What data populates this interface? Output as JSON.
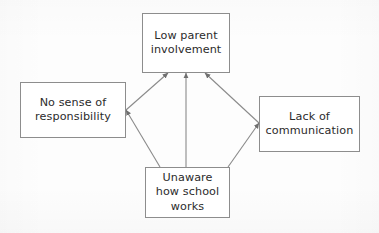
{
  "diagram": {
    "background_color": "#fdfdfd",
    "node_fill": "#ffffff",
    "node_stroke": "#8d8d8d",
    "text_color": "#2b2b2b",
    "edge_color": "#8a8a8a",
    "nodes": [
      {
        "id": "low-parent-involvement",
        "label": "Low parent\ninvolvement",
        "x": 142,
        "y": 13,
        "w": 88,
        "h": 60
      },
      {
        "id": "no-sense-of-responsibility",
        "label": "No sense of\nresponsibility",
        "x": 20,
        "y": 82,
        "w": 106,
        "h": 56
      },
      {
        "id": "lack-of-communication",
        "label": "Lack of\ncommunication",
        "x": 259,
        "y": 96,
        "w": 101,
        "h": 56
      },
      {
        "id": "unaware-how-school-works",
        "label": "Unaware\nhow school\nworks",
        "x": 145,
        "y": 167,
        "w": 85,
        "h": 51
      }
    ],
    "edges": [
      {
        "id": "responsibility-to-involvement",
        "from": "no-sense-of-responsibility",
        "to": "low-parent-involvement",
        "arrowhead": "to",
        "x1": 126,
        "y1": 110,
        "x2": 168,
        "y2": 73
      },
      {
        "id": "unaware-to-involvement",
        "from": "unaware-how-school-works",
        "to": "low-parent-involvement",
        "arrowhead": "to",
        "x1": 186,
        "y1": 167,
        "x2": 186,
        "y2": 73
      },
      {
        "id": "communication-to-involvement",
        "from": "lack-of-communication",
        "to": "low-parent-involvement",
        "arrowhead": "to",
        "x1": 259,
        "y1": 123,
        "x2": 205,
        "y2": 73
      },
      {
        "id": "unaware-to-responsibility",
        "from": "unaware-how-school-works",
        "to": "no-sense-of-responsibility",
        "arrowhead": "to",
        "x1": 160,
        "y1": 167,
        "x2": 126,
        "y2": 110
      },
      {
        "id": "unaware-to-communication",
        "from": "unaware-how-school-works",
        "to": "lack-of-communication",
        "arrowhead": "to",
        "x1": 228,
        "y1": 167,
        "x2": 259,
        "y2": 123
      }
    ]
  }
}
